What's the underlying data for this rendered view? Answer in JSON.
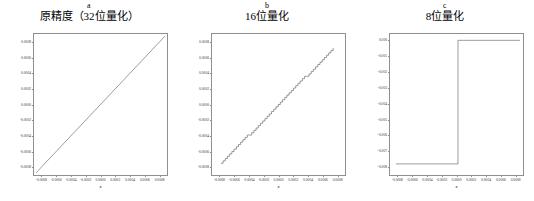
{
  "figure": {
    "panel_count": 3,
    "background": "#ffffff",
    "line_color": "#4a4a4a",
    "frame_color": "#8f8f8f"
  },
  "chart_data": [
    {
      "type": "line",
      "panel_letter": "a",
      "title": "原精度（32位量化）",
      "xlabel": "x",
      "ylabel": "",
      "xlim": [
        -0.0009,
        0.0009
      ],
      "ylim": [
        -0.0009,
        0.0009
      ],
      "grid": false,
      "legend": null,
      "xticks": [
        -0.0008,
        -0.0006,
        -0.0004,
        -0.0002,
        0.0,
        0.0002,
        0.0004,
        0.0006,
        0.0008
      ],
      "xticklabels": [
        "-0.0008",
        "-0.0006",
        "-0.0004",
        "-0.0002",
        "0.0000",
        "0.0002",
        "0.0004",
        "0.0006",
        "0.0008"
      ],
      "yticks": [
        -0.0008,
        -0.0006,
        -0.0004,
        -0.0002,
        0.0,
        0.0002,
        0.0004,
        0.0006,
        0.0008
      ],
      "yticklabels": [
        "-0.0008",
        "-0.0006",
        "-0.0004",
        "-0.0002",
        "0.0000",
        "0.0002",
        "0.0004",
        "0.0006",
        "0.0008"
      ],
      "series": [
        {
          "name": "identity",
          "description": "smooth straight line y = x spanning the full range",
          "x": [
            -0.0008,
            -0.0006,
            -0.0004,
            -0.0002,
            0.0,
            0.0002,
            0.0004,
            0.0006,
            0.0008
          ],
          "y": [
            -0.0008,
            -0.0006,
            -0.0004,
            -0.0002,
            0.0,
            0.0002,
            0.0004,
            0.0006,
            0.0008
          ]
        }
      ]
    },
    {
      "type": "line",
      "panel_letter": "b",
      "title": "16位量化",
      "xlabel": "x",
      "ylabel": "",
      "xlim": [
        -0.0009,
        0.0009
      ],
      "ylim": [
        -0.0009,
        0.0009
      ],
      "grid": false,
      "legend": null,
      "xticks": [
        -0.0008,
        -0.0006,
        -0.0004,
        -0.0002,
        0.0,
        0.0002,
        0.0004,
        0.0006,
        0.0008
      ],
      "xticklabels": [
        "-0.0008",
        "-0.0006",
        "-0.0004",
        "-0.0002",
        "0.0000",
        "0.0002",
        "0.0004",
        "0.0006",
        "0.0008"
      ],
      "yticks": [
        -0.0008,
        -0.0006,
        -0.0004,
        -0.0002,
        0.0,
        0.0002,
        0.0004,
        0.0006,
        0.0008
      ],
      "yticklabels": [
        "-0.0008",
        "-0.0006",
        "-0.0004",
        "-0.0002",
        "0.0000",
        "0.0002",
        "0.0004",
        "0.0006",
        "0.0008"
      ],
      "series": [
        {
          "name": "quantized-16bit",
          "description": "staircase approximation of y = x with fine quantization steps",
          "quantization_step": 3e-05,
          "x_start": -0.00078,
          "x_end": 0.00074,
          "y_start": -0.00075,
          "y_end": 0.00072
        }
      ]
    },
    {
      "type": "line",
      "panel_letter": "c",
      "title": "8位量化",
      "xlabel": "x",
      "ylabel": "",
      "xlim": [
        -0.0009,
        0.0009
      ],
      "ylim": [
        -0.0085,
        0.0004
      ],
      "grid": false,
      "legend": null,
      "xticks": [
        -0.0008,
        -0.0006,
        -0.0004,
        -0.0002,
        0.0,
        0.0002,
        0.0004,
        0.0006,
        0.0008
      ],
      "xticklabels": [
        "-0.0008",
        "-0.0006",
        "-0.0004",
        "-0.0002",
        "0.0000",
        "0.0002",
        "0.0004",
        "0.0006",
        "0.0008"
      ],
      "yticks": [
        0.0,
        -0.001,
        -0.002,
        -0.003,
        -0.004,
        -0.005,
        -0.006,
        -0.007,
        -0.008
      ],
      "yticklabels": [
        "0.000",
        "-0.001",
        "-0.002",
        "-0.003",
        "-0.004",
        "-0.005",
        "-0.006",
        "-0.007",
        "-0.008"
      ],
      "series": [
        {
          "name": "quantized-8bit",
          "description": "two-level step function: flat at -0.0078 then jumps to 0.0000 near x = 0",
          "step_x": 2e-05,
          "low_level": -0.0078,
          "high_level": 0.0,
          "x": [
            -0.00082,
            2e-05,
            2e-05,
            0.00086
          ],
          "y": [
            -0.0078,
            -0.0078,
            0.0,
            0.0
          ]
        }
      ]
    }
  ]
}
